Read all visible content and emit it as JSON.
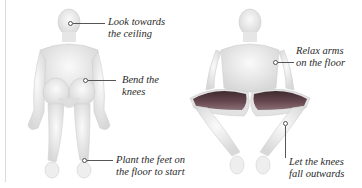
{
  "figures": {
    "left": {
      "name": "start position",
      "labels": [
        {
          "line1": "Look towards",
          "line2": "the ceiling"
        },
        {
          "line1": "Bend the",
          "line2": "knees"
        },
        {
          "line1": "Plant the feet on",
          "line2": "the floor to start"
        }
      ]
    },
    "right": {
      "name": "knees fallen outwards",
      "labels": [
        {
          "line1": "Relax arms",
          "line2": "on the floor"
        },
        {
          "line1": "Let the knees",
          "line2": "fall outwards"
        }
      ]
    }
  },
  "colors": {
    "body": "#ececec",
    "body_shade": "#d4d4d4",
    "muscle": "#5a3d44",
    "text": "#2a2a2a",
    "leader": "#555555"
  }
}
